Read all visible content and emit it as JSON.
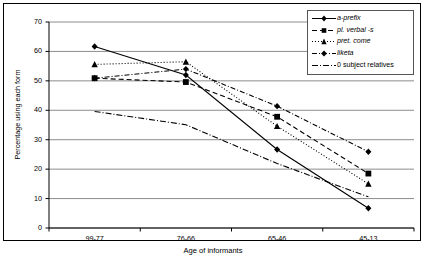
{
  "chart_data": {
    "type": "line",
    "title": "",
    "xlabel": "Age of informants",
    "ylabel": "Percentage using each form",
    "categories": [
      "99-77",
      "76-66",
      "65-46",
      "45-13"
    ],
    "ylim": [
      0,
      70
    ],
    "yticks": [
      0,
      10,
      20,
      30,
      40,
      50,
      60,
      70
    ],
    "grid": "horizontal",
    "legend_position": "top-right",
    "series": [
      {
        "name": "a-prefix",
        "values": [
          61.7,
          52.0,
          26.7,
          6.7
        ],
        "marker": "diamond",
        "dash": "solid"
      },
      {
        "name": "pl. verbal -s",
        "values": [
          50.9,
          49.6,
          37.8,
          18.5
        ],
        "marker": "square",
        "dash": "dashed"
      },
      {
        "name": "pret. come",
        "values": [
          55.6,
          56.5,
          34.6,
          15.0
        ],
        "marker": "triangle",
        "dash": "dotted"
      },
      {
        "name": "liketa",
        "values": [
          50.9,
          54.0,
          41.4,
          25.9
        ],
        "marker": "diamond",
        "dash": "dash"
      },
      {
        "name": "0 subject relatives",
        "values": [
          39.6,
          35.1,
          21.9,
          10.6
        ],
        "marker": "none",
        "dash": "dashdot"
      }
    ]
  },
  "legend": {
    "items": [
      {
        "label": "a-prefix",
        "italic": true
      },
      {
        "label": "pl. verbal -s",
        "italic": true
      },
      {
        "label": "pret. come",
        "italic": true
      },
      {
        "label": "liketa",
        "italic": true
      },
      {
        "label": "0 subject relatives",
        "italic": false
      }
    ]
  },
  "colors": {
    "ink": "#000000",
    "grid": "#808080",
    "frame": "#000000",
    "background": "#ffffff"
  }
}
